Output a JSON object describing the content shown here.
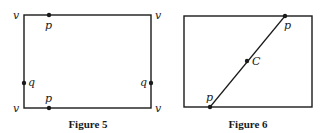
{
  "figures": [
    {
      "caption": "Figure 5",
      "rect": {
        "x": 24,
        "y": 15,
        "w": 127,
        "h": 93
      },
      "vertex_labels": [
        "v",
        "v",
        "v",
        "v"
      ],
      "points": [
        {
          "label": "p",
          "x": 49,
          "y": 15
        },
        {
          "label": "p",
          "x": 49,
          "y": 108
        },
        {
          "label": "q",
          "x": 24,
          "y": 83
        },
        {
          "label": "q",
          "x": 151,
          "y": 83
        }
      ]
    },
    {
      "caption": "Figure 6",
      "rect": {
        "x": 184,
        "y": 16,
        "w": 128,
        "h": 91
      },
      "segment": {
        "from": "p",
        "to": "p"
      },
      "points": [
        {
          "label": "p",
          "x": 285,
          "y": 16
        },
        {
          "label": "C",
          "x": 247,
          "y": 61
        },
        {
          "label": "p",
          "x": 210,
          "y": 107
        }
      ]
    }
  ],
  "colors": {
    "stroke": "#1a1a1a",
    "background": "#ffffff"
  }
}
